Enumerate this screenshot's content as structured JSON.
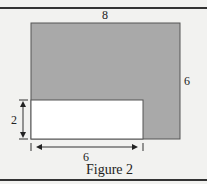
{
  "figure": {
    "caption": "Figure 2",
    "labels": {
      "top_width": "8",
      "right_height": "6",
      "cutout_height": "2",
      "cutout_width": "6"
    },
    "colors": {
      "shaded": "#a9a9a9",
      "cutout": "#ffffff",
      "outline": "#555555",
      "background": "#f2f2f0"
    }
  }
}
